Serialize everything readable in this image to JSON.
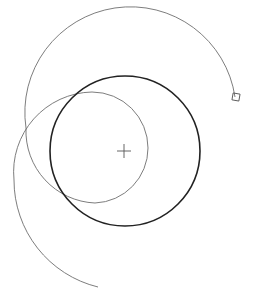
{
  "diagram": {
    "type": "cad-geometry",
    "background": "#ffffff",
    "elements": {
      "main_circle": {
        "cx": 125,
        "cy": 151,
        "r": 75,
        "stroke": "#222222",
        "stroke_width": 1.6
      },
      "spiral": {
        "stroke": "#6e6e6e",
        "stroke_width": 0.9
      },
      "center_marker": {
        "x": 124,
        "y": 151,
        "arm": 7,
        "stroke": "#555555"
      },
      "end_grip": {
        "x": 236,
        "y": 97,
        "size": 7,
        "stroke": "#555555"
      }
    }
  }
}
